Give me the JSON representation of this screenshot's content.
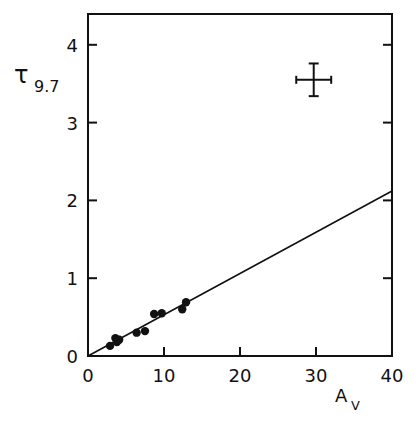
{
  "chart_data": {
    "type": "scatter",
    "title": "",
    "xlabel": "A",
    "xlabel_sub": "V",
    "ylabel": "τ",
    "ylabel_sub": "9.7",
    "xlim": [
      0,
      40
    ],
    "ylim": [
      0,
      4.4
    ],
    "x_ticks": [
      0,
      10,
      20,
      30,
      40
    ],
    "x_tick_labels": [
      "0",
      "10",
      "20",
      "30",
      "40"
    ],
    "y_ticks": [
      0,
      1,
      2,
      3,
      4
    ],
    "y_tick_labels": [
      "0",
      "1",
      "2",
      "3",
      "4"
    ],
    "grid": false,
    "legend": null,
    "series": [
      {
        "name": "observations",
        "kind": "scatter",
        "x": [
          2.9,
          3.6,
          3.8,
          4.1,
          6.4,
          7.5,
          8.7,
          9.7,
          12.4,
          12.9
        ],
        "y": [
          0.13,
          0.23,
          0.18,
          0.21,
          0.3,
          0.32,
          0.54,
          0.55,
          0.6,
          0.69
        ]
      },
      {
        "name": "linear fit",
        "kind": "line",
        "x": [
          0,
          40
        ],
        "y": [
          0,
          2.12
        ]
      }
    ],
    "annotations": [
      {
        "kind": "error-bar-cross",
        "center": [
          29.7,
          3.55
        ],
        "x_halfwidth": 2.3,
        "y_halfwidth": 0.21
      }
    ]
  }
}
